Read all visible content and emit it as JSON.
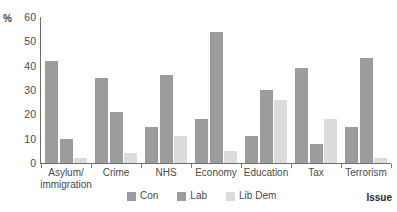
{
  "chart_data": {
    "type": "bar",
    "title": "",
    "subtitle": "",
    "xlabel": "Issue",
    "ylabel": "%",
    "ylim": [
      0,
      60
    ],
    "yticks": [
      0,
      10,
      20,
      30,
      40,
      50,
      60
    ],
    "grid": false,
    "legend_position": "bottom",
    "categories": [
      "Asylum/\nimmigration",
      "Crime",
      "NHS",
      "Economy",
      "Education",
      "Tax",
      "Terrorism"
    ],
    "series": [
      {
        "name": "Con",
        "color": "#9c9c9c",
        "values": [
          42,
          35,
          15,
          18,
          11,
          39,
          15
        ]
      },
      {
        "name": "Lab",
        "color": "#9c9c9c",
        "values": [
          10,
          21,
          36,
          54,
          30,
          8,
          43
        ]
      },
      {
        "name": "Lib Dem",
        "color": "#dcdcdc",
        "values": [
          2,
          4,
          11,
          5,
          26,
          18,
          2
        ]
      }
    ]
  },
  "axis": {
    "percent_sign": "%",
    "y_tick_labels": [
      "60",
      "50",
      "40",
      "30",
      "20",
      "10",
      "0"
    ],
    "x_title": "Issue"
  },
  "legend": {
    "items": [
      {
        "label": "Con",
        "color": "#9c9c9c"
      },
      {
        "label": "Lab",
        "color": "#9c9c9c"
      },
      {
        "label": "Lib Dem",
        "color": "#dcdcdc"
      }
    ]
  },
  "categories_display": [
    {
      "line1": "Asylum/",
      "line2": "immigration"
    },
    {
      "line1": "Crime",
      "line2": ""
    },
    {
      "line1": "NHS",
      "line2": ""
    },
    {
      "line1": "Economy",
      "line2": ""
    },
    {
      "line1": "Education",
      "line2": ""
    },
    {
      "line1": "Tax",
      "line2": ""
    },
    {
      "line1": "Terrorism",
      "line2": ""
    }
  ]
}
